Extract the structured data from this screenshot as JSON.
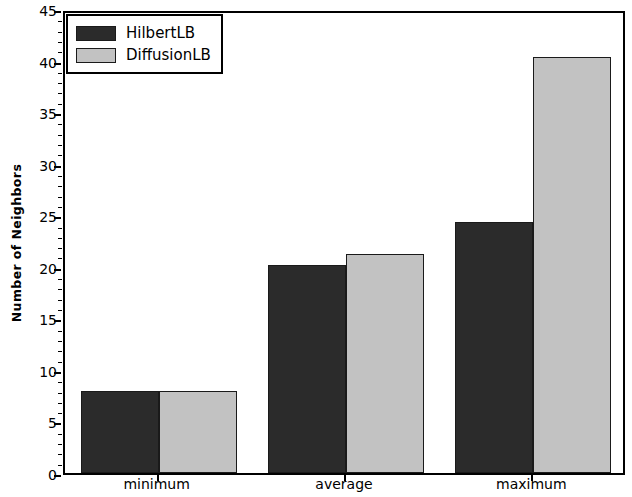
{
  "chart_data": {
    "type": "bar",
    "title": "",
    "subtitle": "",
    "xlabel": "",
    "ylabel": "Number of Neighbors",
    "categories": [
      "minimum",
      "average",
      "maximum"
    ],
    "series": [
      {
        "name": "HilbertLB",
        "color": "#2b2b2b",
        "values": [
          8,
          20.2,
          24.3
        ]
      },
      {
        "name": "DiffusionLB",
        "color": "#c2c2c2",
        "values": [
          8,
          21.2,
          40.3
        ]
      }
    ],
    "ylim": [
      0,
      45
    ],
    "yticks": [
      0,
      5,
      10,
      15,
      20,
      25,
      30,
      35,
      40,
      45
    ],
    "ytick_labels": [
      "0",
      "5",
      "10",
      "15",
      "20",
      "25",
      "30",
      "35",
      "40",
      "45"
    ],
    "grid": false,
    "legend_position": "upper left",
    "legend_entries": [
      "HilbertLB",
      "DiffusionLB"
    ],
    "frame_color": "#000000",
    "background_color": "#ffffff"
  }
}
